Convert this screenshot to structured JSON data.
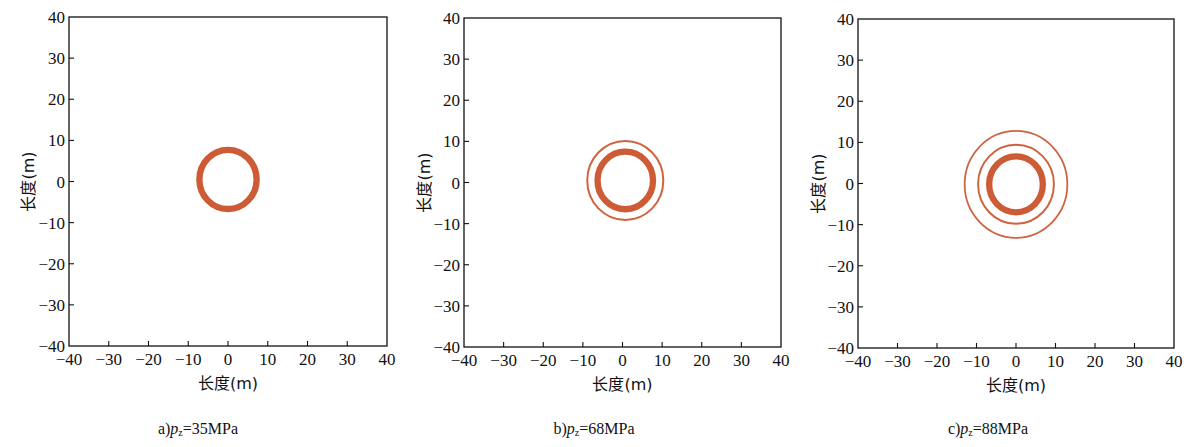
{
  "figure": {
    "ring_color": "#C9522B",
    "axis_color": "#111111"
  },
  "chart_data": [
    {
      "type": "scatter",
      "panel_label": "a)",
      "caption_var": "p",
      "caption_sub": "z",
      "caption_value": "=35MPa",
      "xlabel": "长度(m)",
      "ylabel": "长度(m)",
      "xlim": [
        -40,
        40
      ],
      "ylim": [
        -40,
        40
      ],
      "xticks": [
        -40,
        -30,
        -20,
        -10,
        0,
        10,
        20,
        30,
        40
      ],
      "yticks": [
        -40,
        -30,
        -20,
        -10,
        0,
        10,
        20,
        30,
        40
      ],
      "grid": false,
      "rings": [
        {
          "cx": 0,
          "cy": 0.5,
          "r": 7.2,
          "width_m": 1.6,
          "thick": true
        }
      ]
    },
    {
      "type": "scatter",
      "panel_label": "b)",
      "caption_var": "p",
      "caption_sub": "z",
      "caption_value": "=68MPa",
      "xlabel": "长度(m)",
      "ylabel": "长度(m)",
      "xlim": [
        -40,
        40
      ],
      "ylim": [
        -40,
        40
      ],
      "xticks": [
        -40,
        -30,
        -20,
        -10,
        0,
        10,
        20,
        30,
        40
      ],
      "yticks": [
        -40,
        -30,
        -20,
        -10,
        0,
        10,
        20,
        30,
        40
      ],
      "grid": false,
      "rings": [
        {
          "cx": 0.7,
          "cy": 0.5,
          "r": 7.0,
          "width_m": 1.6,
          "thick": true
        },
        {
          "cx": 0.7,
          "cy": 0.5,
          "r": 9.6,
          "width_m": 0.5,
          "thick": false
        }
      ]
    },
    {
      "type": "scatter",
      "panel_label": "c)",
      "caption_var": "p",
      "caption_sub": "z",
      "caption_value": "=88MPa",
      "xlabel": "长度(m)",
      "ylabel": "长度(m)",
      "xlim": [
        -40,
        40
      ],
      "ylim": [
        -40,
        40
      ],
      "xticks": [
        -40,
        -30,
        -20,
        -10,
        0,
        10,
        20,
        30,
        40
      ],
      "yticks": [
        -40,
        -30,
        -20,
        -10,
        0,
        10,
        20,
        30,
        40
      ],
      "grid": false,
      "rings": [
        {
          "cx": 0,
          "cy": -0.2,
          "r": 6.8,
          "width_m": 1.6,
          "thick": true
        },
        {
          "cx": 0,
          "cy": -0.2,
          "r": 9.6,
          "width_m": 0.5,
          "thick": false
        },
        {
          "cx": 0,
          "cy": -0.2,
          "r": 13.0,
          "width_m": 0.45,
          "thick": false
        }
      ]
    }
  ]
}
